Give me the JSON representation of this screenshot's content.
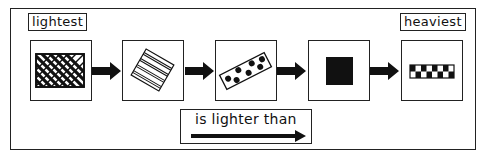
{
  "diagram": {
    "type": "ordering",
    "start_label": "lightest",
    "end_label": "heaviest",
    "legend": {
      "text": "is lighter than",
      "symbol": "arrow-right"
    },
    "items": [
      {
        "index": 1,
        "shape": "rectangle",
        "pattern": "diagonal-crosshatch",
        "fill": "black-and-white"
      },
      {
        "index": 2,
        "shape": "rotated-square",
        "pattern": "parallel-stripes",
        "fill": "white"
      },
      {
        "index": 3,
        "shape": "rotated-bar",
        "pattern": "black-dots",
        "fill": "white"
      },
      {
        "index": 4,
        "shape": "square",
        "pattern": "solid",
        "fill": "black"
      },
      {
        "index": 5,
        "shape": "bar",
        "pattern": "checkerboard",
        "fill": "black-and-white"
      }
    ],
    "arrows": [
      {
        "from": 1,
        "to": 2
      },
      {
        "from": 2,
        "to": 3
      },
      {
        "from": 3,
        "to": 4
      },
      {
        "from": 4,
        "to": 5
      }
    ],
    "colors": {
      "ink": "#111111",
      "background": "#ffffff"
    }
  }
}
